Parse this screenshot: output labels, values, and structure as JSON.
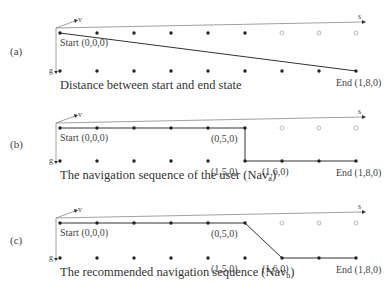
{
  "grid": {
    "columns": 9,
    "col_x": [
      60,
      97,
      134,
      171,
      208,
      245,
      282,
      319,
      356
    ],
    "hollow_top_columns": [
      6,
      7,
      8
    ],
    "colors": {
      "filled": "#222222",
      "hollow": "#aaaaaa",
      "line": "#333333",
      "axis": "#888888"
    }
  },
  "axes": {
    "s": "s",
    "v": "v",
    "g": "g"
  },
  "panels": [
    {
      "id": "a",
      "label": "(a)",
      "top_y": 33,
      "bottom_y": 71,
      "caption": "Distance between start and end state",
      "caption_sub": "",
      "caption_suffix": "",
      "start_label": "Start (0,0,0)",
      "end_label": "End (1,8,0)",
      "path": [
        [
          0,
          0
        ],
        [
          8,
          1
        ]
      ],
      "point_labels": []
    },
    {
      "id": "b",
      "label": "(b)",
      "top_y": 128,
      "bottom_y": 161,
      "caption": "The navigation sequence of the user (Nav",
      "caption_sub": "a",
      "caption_suffix": ")",
      "start_label": "Start (0,0,0)",
      "end_label": "End (1,8,0)",
      "path": [
        [
          0,
          0
        ],
        [
          5,
          0
        ],
        [
          5,
          1
        ],
        [
          8,
          1
        ]
      ],
      "point_labels": [
        {
          "text": "(0,5,0)",
          "col": 5,
          "row": 0
        },
        {
          "text": "(1,5,0)",
          "col": 5,
          "row": 1
        },
        {
          "text": "(1,6,0)",
          "col": 6,
          "row": 1
        }
      ]
    },
    {
      "id": "c",
      "label": "(c)",
      "top_y": 223,
      "bottom_y": 258,
      "caption": "The recommended navigation sequence (Nav",
      "caption_sub": "b",
      "caption_suffix": ")",
      "start_label": "Start (0,0,0)",
      "end_label": "End (1,8,0)",
      "path": [
        [
          0,
          0
        ],
        [
          5,
          0
        ],
        [
          6,
          1
        ],
        [
          8,
          1
        ]
      ],
      "point_labels": [
        {
          "text": "(0,5,0)",
          "col": 5,
          "row": 0
        },
        {
          "text": "(1,5,0)",
          "col": 5,
          "row": 1
        },
        {
          "text": "(1,6,0)",
          "col": 6,
          "row": 1
        }
      ]
    }
  ]
}
